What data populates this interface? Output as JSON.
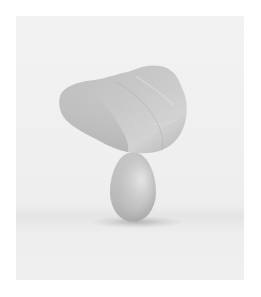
{
  "image": {
    "description": "Photograph of a rough grey rock balanced on top of a single egg against a light grey background",
    "subjects": [
      "rock",
      "egg"
    ],
    "colors": {
      "frame": "#ffffff",
      "background": "#f0f0f0",
      "rock": "#bcbcbc",
      "egg": "#c2c2c2",
      "shadow": "#8a8a8a"
    }
  }
}
